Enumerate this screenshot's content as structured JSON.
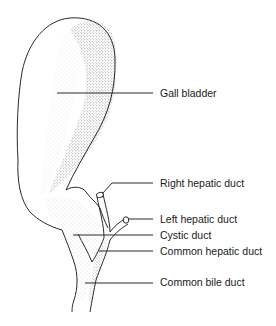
{
  "diagram": {
    "line_color": "#2a2a2a",
    "stipple_color": "#6a6a6a",
    "labels": [
      {
        "id": "gall-bladder",
        "text": "Gall bladder",
        "x": 160,
        "y": 87
      },
      {
        "id": "right-hepatic-duct",
        "text": "Right hepatic duct",
        "x": 160,
        "y": 177
      },
      {
        "id": "left-hepatic-duct",
        "text": "Left hepatic duct",
        "x": 160,
        "y": 213
      },
      {
        "id": "cystic-duct",
        "text": "Cystic duct",
        "x": 160,
        "y": 229
      },
      {
        "id": "common-hepatic-duct",
        "text": "Common hepatic duct",
        "x": 160,
        "y": 245
      },
      {
        "id": "common-bile-duct",
        "text": "Common bile duct",
        "x": 160,
        "y": 276
      }
    ]
  }
}
